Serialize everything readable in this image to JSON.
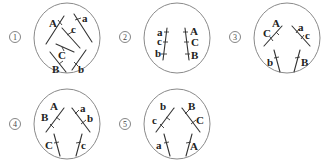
{
  "figure": {
    "colors": {
      "circle": "#8a8a8a",
      "line": "#333333",
      "text": "#222222"
    },
    "cells": [
      {
        "id": "1",
        "label": "①",
        "cx": 67,
        "cy": 38,
        "r": 34,
        "lx": 15,
        "ly": 40,
        "chromosomes": [
          {
            "x1": 46,
            "y1": 44,
            "x2": 64,
            "y2": 16
          },
          {
            "x1": 74,
            "y1": 14,
            "x2": 92,
            "y2": 42
          },
          {
            "x1": 62,
            "y1": 28,
            "x2": 80,
            "y2": 48
          },
          {
            "x1": 56,
            "y1": 44,
            "x2": 74,
            "y2": 52
          },
          {
            "x1": 50,
            "y1": 52,
            "x2": 66,
            "y2": 72
          },
          {
            "x1": 86,
            "y1": 50,
            "x2": 72,
            "y2": 70
          }
        ],
        "genes": [
          {
            "text": "A",
            "x": 49,
            "y": 27,
            "tx1": 58,
            "ty1": 20,
            "tx2": 62,
            "ty2": 25
          },
          {
            "text": "a",
            "x": 82,
            "y": 22,
            "tx1": 75,
            "ty1": 20,
            "tx2": 81,
            "ty2": 18
          },
          {
            "text": "c",
            "x": 71,
            "y": 33,
            "tx1": 67,
            "ty1": 35,
            "tx2": 72,
            "ty2": 32
          },
          {
            "text": "C",
            "x": 58,
            "y": 59,
            "tx1": 62,
            "ty1": 47,
            "tx2": 64,
            "ty2": 51
          },
          {
            "text": "B",
            "x": 52,
            "y": 73,
            "tx1": 59,
            "ty1": 64,
            "tx2": 63,
            "ty2": 61
          },
          {
            "text": "b",
            "x": 78,
            "y": 73,
            "tx1": 74,
            "ty1": 62,
            "tx2": 78,
            "ty2": 66
          }
        ]
      },
      {
        "id": "2",
        "label": "②",
        "cx": 177,
        "cy": 38,
        "r": 34,
        "lx": 125,
        "ly": 40,
        "chromosomes": [
          {
            "x1": 167,
            "y1": 28,
            "x2": 163,
            "y2": 60
          },
          {
            "x1": 185,
            "y1": 28,
            "x2": 189,
            "y2": 60
          }
        ],
        "genes": [
          {
            "text": "a",
            "x": 157,
            "y": 36,
            "tx1": 164,
            "ty1": 32,
            "tx2": 169,
            "ty2": 32
          },
          {
            "text": "c",
            "x": 157,
            "y": 45,
            "tx1": 163,
            "ty1": 42,
            "tx2": 168,
            "ty2": 42
          },
          {
            "text": "b",
            "x": 155,
            "y": 57,
            "tx1": 161,
            "ty1": 54,
            "tx2": 167,
            "ty2": 54
          },
          {
            "text": "A",
            "x": 190,
            "y": 35,
            "tx1": 183,
            "ty1": 32,
            "tx2": 188,
            "ty2": 32
          },
          {
            "text": "C",
            "x": 191,
            "y": 46,
            "tx1": 184,
            "ty1": 42,
            "tx2": 189,
            "ty2": 42
          },
          {
            "text": "B",
            "x": 191,
            "y": 59,
            "tx1": 185,
            "ty1": 54,
            "tx2": 190,
            "ty2": 54
          }
        ]
      },
      {
        "id": "3",
        "label": "③",
        "cx": 287,
        "cy": 38,
        "r": 34,
        "lx": 235,
        "ly": 40,
        "chromosomes": [
          {
            "x1": 264,
            "y1": 46,
            "x2": 282,
            "y2": 26
          },
          {
            "x1": 292,
            "y1": 26,
            "x2": 310,
            "y2": 46
          },
          {
            "x1": 274,
            "y1": 50,
            "x2": 280,
            "y2": 72
          },
          {
            "x1": 300,
            "y1": 50,
            "x2": 294,
            "y2": 72
          }
        ],
        "genes": [
          {
            "text": "A",
            "x": 272,
            "y": 27,
            "tx1": 276,
            "ty1": 32,
            "tx2": 279,
            "ty2": 35
          },
          {
            "text": "C",
            "x": 263,
            "y": 37,
            "tx1": 270,
            "ty1": 37,
            "tx2": 273,
            "ty2": 41
          },
          {
            "text": "a",
            "x": 298,
            "y": 31,
            "tx1": 296,
            "ty1": 33,
            "tx2": 299,
            "ty2": 29
          },
          {
            "text": "c",
            "x": 305,
            "y": 39,
            "tx1": 301,
            "ty1": 39,
            "tx2": 304,
            "ty2": 35
          },
          {
            "text": "b",
            "x": 267,
            "y": 66,
            "tx1": 274,
            "ty1": 58,
            "tx2": 279,
            "ty2": 57
          },
          {
            "text": "B",
            "x": 301,
            "y": 66,
            "tx1": 295,
            "ty1": 58,
            "tx2": 300,
            "ty2": 57
          }
        ]
      },
      {
        "id": "4",
        "label": "④",
        "cx": 67,
        "cy": 124,
        "r": 34,
        "lx": 15,
        "ly": 127,
        "chromosomes": [
          {
            "x1": 46,
            "y1": 132,
            "x2": 64,
            "y2": 108
          },
          {
            "x1": 72,
            "y1": 108,
            "x2": 90,
            "y2": 132
          },
          {
            "x1": 54,
            "y1": 134,
            "x2": 60,
            "y2": 156
          },
          {
            "x1": 82,
            "y1": 134,
            "x2": 76,
            "y2": 156
          }
        ],
        "genes": [
          {
            "text": "A",
            "x": 50,
            "y": 110,
            "tx1": 56,
            "ty1": 117,
            "tx2": 60,
            "ty2": 120
          },
          {
            "text": "B",
            "x": 41,
            "y": 121,
            "tx1": 50,
            "ty1": 124,
            "tx2": 54,
            "ty2": 128
          },
          {
            "text": "a",
            "x": 80,
            "y": 112,
            "tx1": 75,
            "ty1": 114,
            "tx2": 79,
            "ty2": 110
          },
          {
            "text": "b",
            "x": 87,
            "y": 122,
            "tx1": 81,
            "ty1": 124,
            "tx2": 86,
            "ty2": 120
          },
          {
            "text": "C",
            "x": 45,
            "y": 149,
            "tx1": 54,
            "ty1": 143,
            "tx2": 59,
            "ty2": 142
          },
          {
            "text": "c",
            "x": 81,
            "y": 149,
            "tx1": 76,
            "ty1": 143,
            "tx2": 81,
            "ty2": 142
          }
        ]
      },
      {
        "id": "5",
        "label": "⑤",
        "cx": 177,
        "cy": 124,
        "r": 34,
        "lx": 125,
        "ly": 127,
        "chromosomes": [
          {
            "x1": 156,
            "y1": 132,
            "x2": 174,
            "y2": 108
          },
          {
            "x1": 182,
            "y1": 108,
            "x2": 200,
            "y2": 132
          },
          {
            "x1": 164,
            "y1": 134,
            "x2": 170,
            "y2": 156
          },
          {
            "x1": 192,
            "y1": 134,
            "x2": 186,
            "y2": 156
          }
        ],
        "genes": [
          {
            "text": "b",
            "x": 160,
            "y": 110,
            "tx1": 166,
            "ty1": 117,
            "tx2": 170,
            "ty2": 120
          },
          {
            "text": "c",
            "x": 152,
            "y": 124,
            "tx1": 160,
            "ty1": 124,
            "tx2": 164,
            "ty2": 128
          },
          {
            "text": "B",
            "x": 188,
            "y": 110,
            "tx1": 185,
            "ty1": 114,
            "tx2": 189,
            "ty2": 110
          },
          {
            "text": "C",
            "x": 196,
            "y": 124,
            "tx1": 191,
            "ty1": 124,
            "tx2": 196,
            "ty2": 120
          },
          {
            "text": "a",
            "x": 156,
            "y": 149,
            "tx1": 164,
            "ty1": 143,
            "tx2": 169,
            "ty2": 142
          },
          {
            "text": "A",
            "x": 190,
            "y": 150,
            "tx1": 186,
            "ty1": 143,
            "tx2": 191,
            "ty2": 142
          }
        ]
      }
    ]
  }
}
